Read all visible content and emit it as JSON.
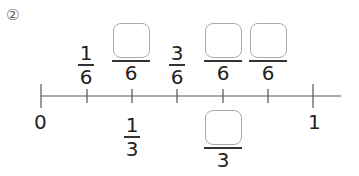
{
  "problem_number": "②",
  "top_fractions": [
    {
      "numerator": "1",
      "denominator": "6",
      "blank": false
    },
    {
      "numerator": "",
      "denominator": "6",
      "blank": true
    },
    {
      "numerator": "3",
      "denominator": "6",
      "blank": false
    },
    {
      "numerator": "",
      "denominator": "6",
      "blank": true
    },
    {
      "numerator": "",
      "denominator": "6",
      "blank": true
    }
  ],
  "axis_labels": {
    "start": "0",
    "end": "1"
  },
  "bottom_fractions": [
    {
      "numerator": "1",
      "denominator": "3",
      "blank": false
    },
    {
      "numerator": "",
      "denominator": "3",
      "blank": true
    }
  ],
  "tick_count": 7
}
